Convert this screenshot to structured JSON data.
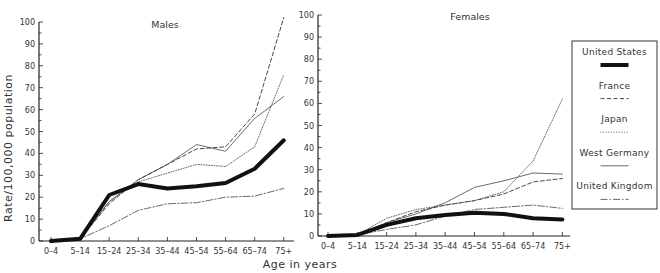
{
  "chart_data": [
    {
      "type": "line",
      "title": "Males",
      "xlabel": "Age in years",
      "ylabel": "Rate/100,000 population",
      "ylim": [
        0,
        100
      ],
      "yticks": [
        0,
        10,
        20,
        30,
        40,
        50,
        60,
        70,
        80,
        90,
        100
      ],
      "categories": [
        "0–4",
        "5–14",
        "15–24",
        "25–34",
        "35–44",
        "45–54",
        "55–64",
        "65–74",
        "75+"
      ],
      "series": [
        {
          "name": "United States",
          "style": "thick",
          "values": [
            0,
            1,
            21,
            26,
            24,
            25,
            26.5,
            33,
            46
          ]
        },
        {
          "name": "France",
          "style": "dashed",
          "values": [
            0,
            1,
            17,
            28,
            35,
            42,
            43,
            58,
            102
          ]
        },
        {
          "name": "Japan",
          "style": "dotted",
          "values": [
            0,
            1,
            18,
            27,
            31,
            35,
            34,
            43,
            76
          ]
        },
        {
          "name": "West Germany",
          "style": "solid",
          "values": [
            0,
            1,
            18,
            28,
            35,
            44,
            41,
            56,
            66
          ]
        },
        {
          "name": "United Kingdom",
          "style": "dashdot",
          "values": [
            0,
            1,
            7,
            14,
            17,
            17.5,
            20,
            20.5,
            24
          ]
        }
      ],
      "grid": false
    },
    {
      "type": "line",
      "title": "Females",
      "xlabel": "Age in years",
      "ylabel": "Rate/100,000 population",
      "ylim": [
        0,
        100
      ],
      "yticks": [
        0,
        10,
        20,
        30,
        40,
        50,
        60,
        70,
        80,
        90,
        100
      ],
      "categories": [
        "0–4",
        "5–14",
        "15–24",
        "25–34",
        "35–44",
        "45–54",
        "55–64",
        "65–74",
        "75+"
      ],
      "series": [
        {
          "name": "United States",
          "style": "thick",
          "values": [
            0,
            0.5,
            5,
            8,
            9.5,
            10.5,
            10,
            8,
            7.5
          ]
        },
        {
          "name": "France",
          "style": "dashed",
          "values": [
            0,
            0.5,
            6,
            11,
            14,
            16,
            19,
            24.5,
            26
          ]
        },
        {
          "name": "Japan",
          "style": "dotted",
          "values": [
            0,
            0.5,
            8,
            12,
            14,
            16,
            20,
            34,
            62
          ]
        },
        {
          "name": "West Germany",
          "style": "solid",
          "values": [
            0,
            0.5,
            6,
            10,
            15,
            22,
            25,
            28.5,
            28
          ]
        },
        {
          "name": "United Kingdom",
          "style": "dashdot",
          "values": [
            0,
            0.5,
            3,
            5,
            9,
            12,
            13,
            14,
            12.5
          ]
        }
      ],
      "grid": false
    }
  ],
  "legend": {
    "placement": "right",
    "entries": [
      {
        "name": "United States",
        "style": "thick"
      },
      {
        "name": "France",
        "style": "dashed"
      },
      {
        "name": "Japan",
        "style": "dotted"
      },
      {
        "name": "West Germany",
        "style": "solid"
      },
      {
        "name": "United Kingdom",
        "style": "dashdot"
      }
    ]
  },
  "shared": {
    "xlabel": "Age in years",
    "ylabel": "Rate/100,000 population"
  }
}
